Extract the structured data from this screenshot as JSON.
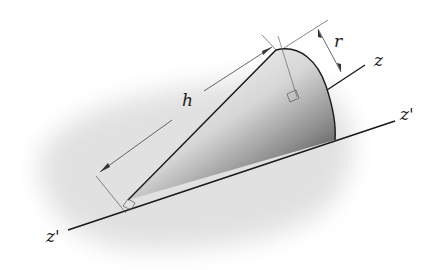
{
  "figure": {
    "labels": {
      "height": "h",
      "radius": "r",
      "axis": "z",
      "tangent_axis_right": "z'",
      "tangent_axis_left": "z'"
    },
    "colors": {
      "background": "#ffffff",
      "shadow": "#e6e6e6",
      "outline": "#1a1a1a",
      "dimension": "#444444"
    }
  }
}
